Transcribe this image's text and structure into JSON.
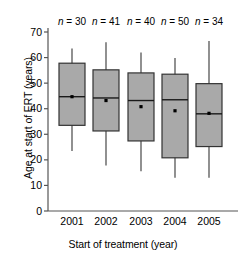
{
  "chart_data": {
    "type": "box",
    "title": "",
    "xlabel": "Start of treatment (year)",
    "ylabel": "Age at start of ERT (years)",
    "categories": [
      "2001",
      "2002",
      "2003",
      "2004",
      "2005"
    ],
    "ylim": [
      0,
      70
    ],
    "ytick_labels": [
      "0",
      "10",
      "20",
      "30",
      "40",
      "50",
      "60",
      "70"
    ],
    "ytick_values": [
      0,
      10,
      20,
      30,
      40,
      50,
      60,
      70
    ],
    "grid": false,
    "legend": "none",
    "annotations": [
      "n = 30",
      "n = 41",
      "n = 40",
      "n = 50",
      "n = 34"
    ],
    "counts": [
      30,
      41,
      40,
      50,
      34
    ],
    "boxes": [
      {
        "category": "2001",
        "n_label": "n = 30",
        "whisker_low": 23.5,
        "q1": 33.5,
        "median": 44.7,
        "mean": 44.7,
        "q3": 57.8,
        "whisker_high": 63.5
      },
      {
        "category": "2002",
        "n_label": "n = 41",
        "whisker_low": 17.8,
        "q1": 31.3,
        "median": 44.2,
        "mean": 43.2,
        "q3": 55.2,
        "whisker_high": 66.0
      },
      {
        "category": "2003",
        "n_label": "n = 40",
        "whisker_low": 15.5,
        "q1": 27.4,
        "median": 43.2,
        "mean": 40.8,
        "q3": 54.0,
        "whisker_high": 62.0
      },
      {
        "category": "2004",
        "n_label": "n = 50",
        "whisker_low": 13.0,
        "q1": 20.8,
        "median": 43.5,
        "mean": 39.2,
        "q3": 53.5,
        "whisker_high": 59.8
      },
      {
        "category": "2005",
        "n_label": "n = 34",
        "whisker_low": 13.0,
        "q1": 25.2,
        "median": 38.0,
        "mean": 38.2,
        "q3": 49.8,
        "whisker_high": 66.5
      }
    ],
    "colors": {
      "box_fill": "#a9a9a9",
      "box_edge": "#333333",
      "whisker": "#555555",
      "median": "#1a1a1a",
      "mean_marker": "#000000",
      "axis": "#555555",
      "text": "#000000"
    }
  }
}
